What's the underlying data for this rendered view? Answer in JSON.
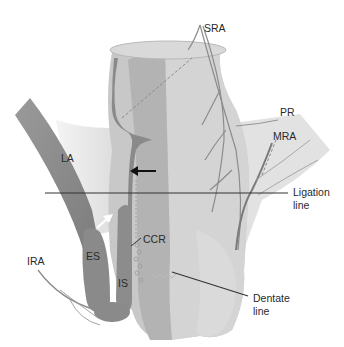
{
  "figure": {
    "type": "anatomical-diagram",
    "labels": {
      "sra": "SRA",
      "pr": "PR",
      "mra": "MRA",
      "la": "LA",
      "ligation_1": "Ligation",
      "ligation_2": "line",
      "ccr": "CCR",
      "es": "ES",
      "is": "IS",
      "ira": "IRA",
      "dentate_1": "Dentate",
      "dentate_2": "line"
    },
    "colors": {
      "background": "#ffffff",
      "rectum_outer": "#c9c9c9",
      "rectum_inner": "#b5b5b5",
      "rectum_light": "#d6d6d6",
      "muscle_dark": "#8a8a8a",
      "pelvic_floor": "#e6e6e6",
      "vessel": "#8c8c8c",
      "line": "#333333",
      "arrow_black": "#111111",
      "arrow_white": "#ffffff"
    }
  }
}
